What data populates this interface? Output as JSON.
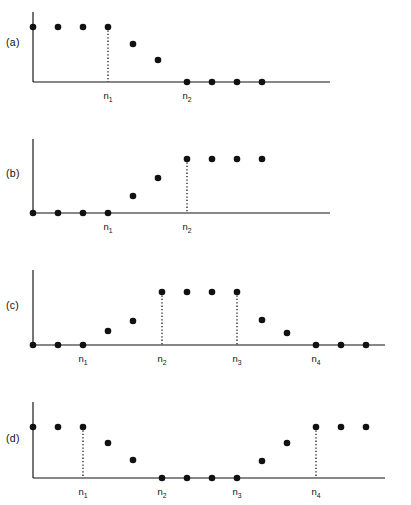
{
  "figure": {
    "background_color": "#ffffff",
    "ink_color": "#111111",
    "width": 411,
    "height": 505,
    "marker_radius": 3.3,
    "panel_count": 4
  },
  "chart_data": [
    {
      "type": "scatter",
      "panel_id": "a",
      "panel_label": "(a)",
      "title": "",
      "xlabel": "",
      "ylabel": "",
      "grid": false,
      "legend": null,
      "description": "Falling step sequence: constant high level through n1, monotone decay, then zero from n2 onward.",
      "axis": {
        "origin_x": 33,
        "baseline_y": 82,
        "y_axis_top": 12,
        "x_axis_end": 330,
        "level_high_y": 27
      },
      "sample_spacing_px": 25,
      "x": [
        33,
        58,
        83,
        108,
        133,
        158,
        187,
        212,
        237,
        262
      ],
      "y_px": [
        27,
        27,
        27,
        27,
        44,
        60,
        82,
        82,
        82,
        82
      ],
      "values": [
        1.0,
        1.0,
        1.0,
        1.0,
        0.69,
        0.4,
        0.0,
        0.0,
        0.0,
        0.0
      ],
      "ylim": [
        0,
        1
      ],
      "tick_labels": [
        {
          "base": "n",
          "sub": "1",
          "x": 108
        },
        {
          "base": "n",
          "sub": "2",
          "x": 187
        }
      ],
      "drop_lines": [
        {
          "x": 108,
          "y_top": 27,
          "y_bottom": 82
        }
      ]
    },
    {
      "type": "scatter",
      "panel_id": "b",
      "panel_label": "(b)",
      "title": "",
      "xlabel": "",
      "ylabel": "",
      "grid": false,
      "legend": null,
      "description": "Rising step sequence: zero through n1, monotone rise, then constant high level from n2 onward.",
      "axis": {
        "origin_x": 33,
        "baseline_y": 213,
        "y_axis_top": 139,
        "x_axis_end": 330,
        "level_high_y": 159
      },
      "sample_spacing_px": 25,
      "x": [
        33,
        58,
        83,
        108,
        133,
        158,
        187,
        212,
        237,
        262
      ],
      "y_px": [
        213,
        213,
        213,
        213,
        196,
        178,
        159,
        159,
        159,
        159
      ],
      "values": [
        0.0,
        0.0,
        0.0,
        0.0,
        0.31,
        0.65,
        1.0,
        1.0,
        1.0,
        1.0
      ],
      "ylim": [
        0,
        1
      ],
      "tick_labels": [
        {
          "base": "n",
          "sub": "1",
          "x": 108
        },
        {
          "base": "n",
          "sub": "2",
          "x": 187
        }
      ],
      "drop_lines": [
        {
          "x": 187,
          "y_top": 159,
          "y_bottom": 213
        }
      ]
    },
    {
      "type": "scatter",
      "panel_id": "c",
      "panel_label": "(c)",
      "title": "",
      "xlabel": "",
      "ylabel": "",
      "grid": false,
      "legend": null,
      "description": "Trapezoidal band-pass sequence: zero up to n1, rising edge, flat plateau between n2 and n3, falling edge, zero from n4 onward.",
      "axis": {
        "origin_x": 33,
        "baseline_y": 345,
        "y_axis_top": 270,
        "x_axis_end": 385,
        "level_high_y": 292
      },
      "sample_spacing_px": 25,
      "x": [
        33,
        58,
        83,
        108,
        133,
        162,
        187,
        212,
        237,
        262,
        287,
        316,
        341,
        366
      ],
      "y_px": [
        345,
        345,
        345,
        331,
        321,
        292,
        292,
        292,
        292,
        320,
        333,
        345,
        345,
        345
      ],
      "values": [
        0.0,
        0.0,
        0.0,
        0.26,
        0.45,
        1.0,
        1.0,
        1.0,
        1.0,
        0.47,
        0.23,
        0.0,
        0.0,
        0.0
      ],
      "ylim": [
        0,
        1
      ],
      "tick_labels": [
        {
          "base": "n",
          "sub": "1",
          "x": 83
        },
        {
          "base": "n",
          "sub": "2",
          "x": 162
        },
        {
          "base": "n",
          "sub": "3",
          "x": 237
        },
        {
          "base": "n",
          "sub": "4",
          "x": 316
        }
      ],
      "drop_lines": [
        {
          "x": 162,
          "y_top": 292,
          "y_bottom": 345
        },
        {
          "x": 237,
          "y_top": 292,
          "y_bottom": 345
        }
      ]
    },
    {
      "type": "scatter",
      "panel_id": "d",
      "panel_label": "(d)",
      "title": "",
      "xlabel": "",
      "ylabel": "",
      "grid": false,
      "legend": null,
      "description": "Band-stop notch sequence: high level up to n1, falling edge, zero valley between n2 and n3, rising edge, high level from n4 onward.",
      "axis": {
        "origin_x": 33,
        "baseline_y": 478,
        "y_axis_top": 402,
        "x_axis_end": 385,
        "level_high_y": 427
      },
      "sample_spacing_px": 25,
      "x": [
        33,
        58,
        83,
        108,
        133,
        162,
        187,
        212,
        237,
        262,
        287,
        316,
        341,
        366
      ],
      "y_px": [
        427,
        427,
        427,
        443,
        460,
        478,
        478,
        478,
        478,
        461,
        443,
        427,
        427,
        427
      ],
      "values": [
        1.0,
        1.0,
        1.0,
        0.69,
        0.35,
        0.0,
        0.0,
        0.0,
        0.0,
        0.33,
        0.69,
        1.0,
        1.0,
        1.0
      ],
      "ylim": [
        0,
        1
      ],
      "tick_labels": [
        {
          "base": "n",
          "sub": "1",
          "x": 83
        },
        {
          "base": "n",
          "sub": "2",
          "x": 162
        },
        {
          "base": "n",
          "sub": "3",
          "x": 237
        },
        {
          "base": "n",
          "sub": "4",
          "x": 316
        }
      ],
      "drop_lines": [
        {
          "x": 83,
          "y_top": 427,
          "y_bottom": 478
        },
        {
          "x": 316,
          "y_top": 427,
          "y_bottom": 478
        }
      ]
    }
  ],
  "panel_labels": {
    "a": {
      "text": "(a)",
      "x": 6,
      "y": 46
    },
    "b": {
      "text": "(b)",
      "x": 6,
      "y": 177
    },
    "c": {
      "text": "(c)",
      "x": 6,
      "y": 309
    },
    "d": {
      "text": "(d)",
      "x": 6,
      "y": 442
    }
  }
}
